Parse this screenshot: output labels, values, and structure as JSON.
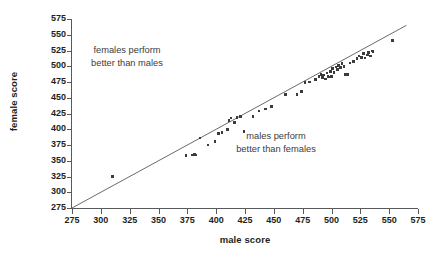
{
  "chart_data": {
    "type": "scatter",
    "title": "",
    "xlabel": "male score",
    "ylabel": "female score",
    "xlim": [
      275,
      575
    ],
    "ylim": [
      275,
      575
    ],
    "xticks": [
      275,
      300,
      325,
      350,
      375,
      400,
      425,
      450,
      475,
      500,
      525,
      550,
      575
    ],
    "yticks": [
      275,
      300,
      325,
      350,
      375,
      400,
      425,
      450,
      475,
      500,
      525,
      550,
      575
    ],
    "tick_step": 25,
    "grid": false,
    "legend": "none",
    "reference_line": {
      "type": "identity",
      "equation": "y = x",
      "from": [
        275,
        275
      ],
      "to": [
        565,
        565
      ]
    },
    "annotations": [
      {
        "name": "females-perform-better",
        "lines": [
          "females perform",
          "better than males"
        ],
        "region": "above-diagonal",
        "x": 350,
        "y": 515
      },
      {
        "name": "males-perform-better",
        "lines": [
          "males perform",
          "better than females"
        ],
        "region": "below-diagonal",
        "x": 497,
        "y": 408
      }
    ],
    "marker": {
      "shape": "square",
      "color": "#3b3b3d",
      "size_px": 2.6
    },
    "n_points": 60,
    "points": [
      {
        "x": 310,
        "y": 325
      },
      {
        "x": 374,
        "y": 358
      },
      {
        "x": 379,
        "y": 359
      },
      {
        "x": 381,
        "y": 360
      },
      {
        "x": 382,
        "y": 359
      },
      {
        "x": 386,
        "y": 386
      },
      {
        "x": 393,
        "y": 375
      },
      {
        "x": 399,
        "y": 381
      },
      {
        "x": 402,
        "y": 393
      },
      {
        "x": 405,
        "y": 395
      },
      {
        "x": 410,
        "y": 400
      },
      {
        "x": 411,
        "y": 414
      },
      {
        "x": 413,
        "y": 418
      },
      {
        "x": 416,
        "y": 411
      },
      {
        "x": 418,
        "y": 419
      },
      {
        "x": 421,
        "y": 420
      },
      {
        "x": 424,
        "y": 396
      },
      {
        "x": 432,
        "y": 420
      },
      {
        "x": 437,
        "y": 429
      },
      {
        "x": 443,
        "y": 432
      },
      {
        "x": 448,
        "y": 436
      },
      {
        "x": 460,
        "y": 455
      },
      {
        "x": 470,
        "y": 455
      },
      {
        "x": 474,
        "y": 460
      },
      {
        "x": 477,
        "y": 474
      },
      {
        "x": 481,
        "y": 475
      },
      {
        "x": 486,
        "y": 479
      },
      {
        "x": 489,
        "y": 484
      },
      {
        "x": 491,
        "y": 487
      },
      {
        "x": 492,
        "y": 482
      },
      {
        "x": 493,
        "y": 486
      },
      {
        "x": 495,
        "y": 480
      },
      {
        "x": 496,
        "y": 489
      },
      {
        "x": 497,
        "y": 484
      },
      {
        "x": 498,
        "y": 483
      },
      {
        "x": 499,
        "y": 492
      },
      {
        "x": 500,
        "y": 484
      },
      {
        "x": 501,
        "y": 496
      },
      {
        "x": 502,
        "y": 490
      },
      {
        "x": 504,
        "y": 499
      },
      {
        "x": 505,
        "y": 495
      },
      {
        "x": 506,
        "y": 501
      },
      {
        "x": 508,
        "y": 498
      },
      {
        "x": 509,
        "y": 504
      },
      {
        "x": 511,
        "y": 500
      },
      {
        "x": 512,
        "y": 487
      },
      {
        "x": 514,
        "y": 487
      },
      {
        "x": 516,
        "y": 505
      },
      {
        "x": 519,
        "y": 508
      },
      {
        "x": 522,
        "y": 512
      },
      {
        "x": 524,
        "y": 516
      },
      {
        "x": 526,
        "y": 514
      },
      {
        "x": 528,
        "y": 520
      },
      {
        "x": 529,
        "y": 513
      },
      {
        "x": 531,
        "y": 518
      },
      {
        "x": 532,
        "y": 522
      },
      {
        "x": 534,
        "y": 516
      },
      {
        "x": 535,
        "y": 524
      },
      {
        "x": 536,
        "y": 523
      },
      {
        "x": 553,
        "y": 541
      }
    ]
  }
}
